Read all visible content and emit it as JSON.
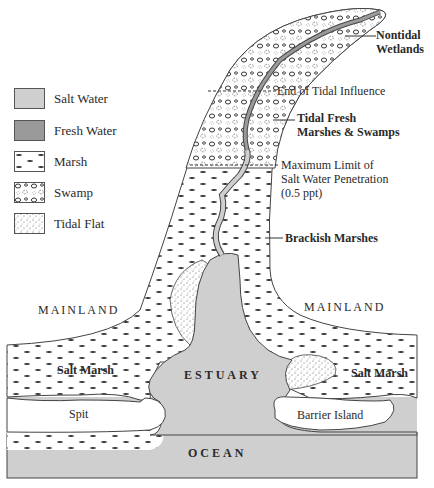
{
  "colors": {
    "salt_water": "#cfcfcf",
    "fresh_water": "#9a9a9a",
    "outline": "#444444",
    "background": "#ffffff"
  },
  "legend": {
    "items": [
      {
        "key": "salt-water",
        "label": "Salt Water"
      },
      {
        "key": "fresh-water",
        "label": "Fresh Water"
      },
      {
        "key": "marsh",
        "label": "Marsh"
      },
      {
        "key": "swamp",
        "label": "Swamp"
      },
      {
        "key": "tidal-flat",
        "label": "Tidal Flat"
      }
    ]
  },
  "callouts": {
    "nontidal_wetlands": [
      "Nontidal",
      "Wetlands"
    ],
    "end_tidal_influence": "End of Tidal Influence",
    "tidal_fresh": [
      "Tidal Fresh",
      "Marshes & Swamps"
    ],
    "max_salt": [
      "Maximum Limit of",
      "Salt Water Penetration",
      "(0.5 ppt)"
    ],
    "brackish": "Brackish Marshes"
  },
  "regions": {
    "mainland_left": "MAINLAND",
    "mainland_right": "MAINLAND",
    "salt_marsh_left": "Salt Marsh",
    "salt_marsh_right": "Salt Marsh",
    "spit": "Spit",
    "barrier_island": "Barrier Island",
    "estuary": "ESTUARY",
    "ocean": "OCEAN"
  }
}
